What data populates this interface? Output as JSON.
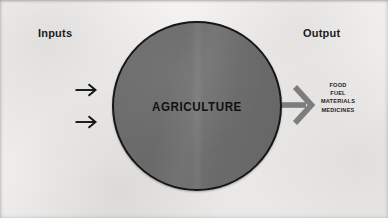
{
  "diagram": {
    "left_header": "Inputs",
    "right_header": "Output",
    "center_node": {
      "label": "AGRICULTURE",
      "shape": "circle",
      "fill_color": "#6d6d6d",
      "outline_color": "#161616"
    },
    "background_color": "#f2f1ef",
    "input_arrows": [
      {
        "name": "input-arrow-upper",
        "direction": "right",
        "color": "#141414"
      },
      {
        "name": "input-arrow-lower",
        "direction": "right",
        "color": "#141414"
      }
    ],
    "output_arrow": {
      "name": "output-arrow",
      "direction": "right",
      "color": "#7d7d7d"
    },
    "output_items": [
      "FOOD",
      "FUEL",
      "MATERIALS",
      "MEDICINES"
    ]
  }
}
